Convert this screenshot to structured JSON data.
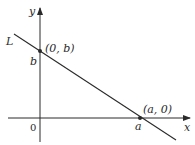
{
  "diagram": {
    "type": "coordinate-line",
    "axes": {
      "x_label": "x",
      "y_label": "y",
      "origin_label": "0"
    },
    "line": {
      "label": "L"
    },
    "points": [
      {
        "id": "y-intercept",
        "label": "(0, b)",
        "axis_tick": "b"
      },
      {
        "id": "x-intercept",
        "label": "(a, 0)",
        "axis_tick": "a"
      }
    ],
    "colors": {
      "stroke": "#2a2a2a",
      "background": "#ffffff"
    }
  }
}
